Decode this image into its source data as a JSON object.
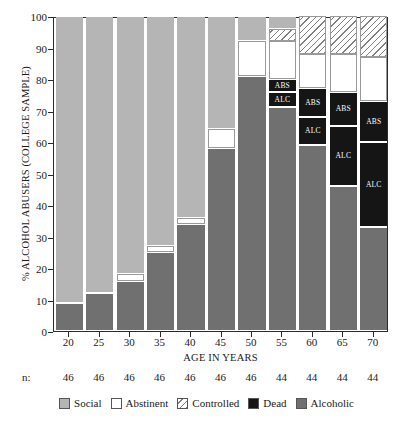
{
  "chart_data": {
    "type": "bar",
    "subtype": "stacked-bar-100",
    "title": "",
    "xlabel": "AGE IN YEARS",
    "ylabel": "% ALCOHOL ABUSERS (COLLEGE SAMPLE)",
    "ylim": [
      0,
      100
    ],
    "yticks": [
      0,
      10,
      20,
      30,
      40,
      50,
      60,
      70,
      80,
      90,
      100
    ],
    "grid": false,
    "legend_position": "bottom",
    "categories": [
      "20",
      "25",
      "30",
      "35",
      "40",
      "45",
      "50",
      "55",
      "60",
      "65",
      "70"
    ],
    "sample_sizes": [
      "46",
      "46",
      "46",
      "46",
      "46",
      "46",
      "46",
      "44",
      "44",
      "44",
      "44"
    ],
    "sample_size_prefix": "n:",
    "series": [
      {
        "name": "Alcoholic",
        "color": "#707070",
        "values": [
          9,
          12,
          16,
          25,
          34,
          58,
          81,
          71,
          59,
          46,
          33
        ]
      },
      {
        "name": "Dead",
        "color": "#151515",
        "values": [
          0,
          0,
          0,
          0,
          0,
          0,
          0,
          9,
          18,
          30,
          40
        ]
      },
      {
        "name": "Abstinent",
        "color": "#ffffff",
        "values": [
          0,
          0,
          2,
          2,
          2,
          6,
          11,
          12,
          11,
          12,
          14
        ]
      },
      {
        "name": "Controlled",
        "color": "hatched",
        "values": [
          0,
          0,
          0,
          0,
          0,
          0,
          0,
          4,
          12,
          12,
          13
        ]
      },
      {
        "name": "Social",
        "color": "#b5b5b5",
        "values": [
          91,
          88,
          82,
          73,
          64,
          36,
          8,
          4,
          0,
          0,
          0
        ]
      }
    ],
    "bars": [
      {
        "category": "20",
        "segments": [
          {
            "series": "Alcoholic",
            "from": 0,
            "to": 9,
            "label": ""
          },
          {
            "series": "Social",
            "from": 9,
            "to": 100,
            "label": ""
          }
        ]
      },
      {
        "category": "25",
        "segments": [
          {
            "series": "Alcoholic",
            "from": 0,
            "to": 12,
            "label": ""
          },
          {
            "series": "Social",
            "from": 12,
            "to": 100,
            "label": ""
          }
        ]
      },
      {
        "category": "30",
        "segments": [
          {
            "series": "Alcoholic",
            "from": 0,
            "to": 16,
            "label": ""
          },
          {
            "series": "Abstinent",
            "from": 16,
            "to": 18,
            "label": ""
          },
          {
            "series": "Social",
            "from": 18,
            "to": 100,
            "label": ""
          }
        ]
      },
      {
        "category": "35",
        "segments": [
          {
            "series": "Alcoholic",
            "from": 0,
            "to": 25,
            "label": ""
          },
          {
            "series": "Abstinent",
            "from": 25,
            "to": 27,
            "label": ""
          },
          {
            "series": "Social",
            "from": 27,
            "to": 100,
            "label": ""
          }
        ]
      },
      {
        "category": "40",
        "segments": [
          {
            "series": "Alcoholic",
            "from": 0,
            "to": 34,
            "label": ""
          },
          {
            "series": "Abstinent",
            "from": 34,
            "to": 36,
            "label": ""
          },
          {
            "series": "Social",
            "from": 36,
            "to": 100,
            "label": ""
          }
        ]
      },
      {
        "category": "45",
        "segments": [
          {
            "series": "Alcoholic",
            "from": 0,
            "to": 58,
            "label": ""
          },
          {
            "series": "Abstinent",
            "from": 58,
            "to": 64,
            "label": ""
          },
          {
            "series": "Social",
            "from": 64,
            "to": 100,
            "label": ""
          }
        ]
      },
      {
        "category": "50",
        "segments": [
          {
            "series": "Alcoholic",
            "from": 0,
            "to": 81,
            "label": ""
          },
          {
            "series": "Abstinent",
            "from": 81,
            "to": 92,
            "label": ""
          },
          {
            "series": "Social",
            "from": 92,
            "to": 100,
            "label": ""
          }
        ]
      },
      {
        "category": "55",
        "segments": [
          {
            "series": "Alcoholic",
            "from": 0,
            "to": 71,
            "label": ""
          },
          {
            "series": "Dead",
            "from": 71,
            "to": 76,
            "label": "ALC"
          },
          {
            "series": "Dead",
            "from": 76,
            "to": 80,
            "label": "ABS"
          },
          {
            "series": "Abstinent",
            "from": 80,
            "to": 92,
            "label": ""
          },
          {
            "series": "Controlled",
            "from": 92,
            "to": 96,
            "label": ""
          },
          {
            "series": "Social",
            "from": 96,
            "to": 100,
            "label": ""
          }
        ]
      },
      {
        "category": "60",
        "segments": [
          {
            "series": "Alcoholic",
            "from": 0,
            "to": 59,
            "label": ""
          },
          {
            "series": "Dead",
            "from": 59,
            "to": 68,
            "label": "ALC"
          },
          {
            "series": "Dead",
            "from": 68,
            "to": 77,
            "label": "ABS"
          },
          {
            "series": "Abstinent",
            "from": 77,
            "to": 88,
            "label": ""
          },
          {
            "series": "Controlled",
            "from": 88,
            "to": 100,
            "label": ""
          }
        ]
      },
      {
        "category": "65",
        "segments": [
          {
            "series": "Alcoholic",
            "from": 0,
            "to": 46,
            "label": ""
          },
          {
            "series": "Dead",
            "from": 46,
            "to": 65,
            "label": "ALC"
          },
          {
            "series": "Dead",
            "from": 65,
            "to": 76,
            "label": "ABS"
          },
          {
            "series": "Abstinent",
            "from": 76,
            "to": 88,
            "label": ""
          },
          {
            "series": "Controlled",
            "from": 88,
            "to": 100,
            "label": ""
          }
        ]
      },
      {
        "category": "70",
        "segments": [
          {
            "series": "Alcoholic",
            "from": 0,
            "to": 33,
            "label": ""
          },
          {
            "series": "Dead",
            "from": 33,
            "to": 60,
            "label": "ALC"
          },
          {
            "series": "Dead",
            "from": 60,
            "to": 73,
            "label": "ABS"
          },
          {
            "series": "Abstinent",
            "from": 73,
            "to": 87,
            "label": ""
          },
          {
            "series": "Controlled",
            "from": 87,
            "to": 100,
            "label": ""
          }
        ]
      }
    ],
    "legend": [
      {
        "label": "Social",
        "fill": "social"
      },
      {
        "label": "Abstinent",
        "fill": "abstinent"
      },
      {
        "label": "Controlled",
        "fill": "controlled"
      },
      {
        "label": "Dead",
        "fill": "dead"
      },
      {
        "label": "Alcoholic",
        "fill": "alcoholic"
      }
    ],
    "colors": {
      "social": "#b5b5b5",
      "abstinent": "#ffffff",
      "controlled": "#ffffff",
      "dead": "#151515",
      "alcoholic": "#707070",
      "axis": "#2b2b2b",
      "background": "#ffffff"
    }
  }
}
